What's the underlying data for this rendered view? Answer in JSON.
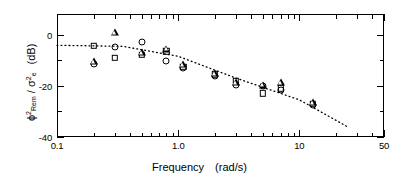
{
  "figure": {
    "x_axis_title_main": "Frequency",
    "x_axis_title_units": "(rad/s)",
    "y_axis_title": "ϕ²Rem / σ²e  (dB)"
  },
  "chart_data": {
    "type": "scatter",
    "title": "",
    "xlabel": "Frequency   (rad/s)",
    "ylabel": "ϕ²_Rem / σ²_e  (dB)",
    "xscale": "log",
    "yscale": "linear",
    "xlim": [
      0.1,
      50
    ],
    "ylim": [
      -40,
      8
    ],
    "grid": false,
    "legend": "none",
    "xticklabels": [
      "0.1",
      "1.0",
      "10",
      "50"
    ],
    "xtickvalues": [
      0.1,
      1.0,
      10,
      50
    ],
    "yticklabels": [
      "0",
      "-20",
      "-40"
    ],
    "ytickvalues": [
      0,
      -20,
      -40
    ],
    "minor_x_ticks": [
      0.2,
      0.3,
      0.4,
      0.5,
      0.6,
      0.7,
      0.8,
      0.9,
      2,
      3,
      4,
      5,
      6,
      7,
      8,
      9,
      20,
      30,
      40
    ],
    "series": [
      {
        "name": "square-markers",
        "marker": "square",
        "points": [
          {
            "x": 0.2,
            "y": -4.5
          },
          {
            "x": 0.3,
            "y": -9.0
          },
          {
            "x": 0.5,
            "y": -8.0
          },
          {
            "x": 0.8,
            "y": -6.5
          },
          {
            "x": 1.1,
            "y": -12.5
          },
          {
            "x": 2.0,
            "y": -15.5
          },
          {
            "x": 3.0,
            "y": -18.0
          },
          {
            "x": 5.0,
            "y": -23.0
          },
          {
            "x": 7.0,
            "y": -21.0
          },
          {
            "x": 13.0,
            "y": -27.0
          }
        ]
      },
      {
        "name": "circle-markers",
        "marker": "circle",
        "points": [
          {
            "x": 0.2,
            "y": -11.5
          },
          {
            "x": 0.3,
            "y": -5.0
          },
          {
            "x": 0.5,
            "y": -3.0
          },
          {
            "x": 0.8,
            "y": -10.5
          },
          {
            "x": 1.1,
            "y": -13.0
          },
          {
            "x": 2.0,
            "y": -16.0
          },
          {
            "x": 3.0,
            "y": -19.5
          },
          {
            "x": 5.0,
            "y": -20.0
          },
          {
            "x": 7.0,
            "y": -21.5
          },
          {
            "x": 13.0,
            "y": -27.5
          }
        ]
      },
      {
        "name": "triangle-markers",
        "marker": "triangle",
        "points": [
          {
            "x": 0.2,
            "y": -10.5
          },
          {
            "x": 0.3,
            "y": 1.0
          },
          {
            "x": 0.5,
            "y": -7.0
          },
          {
            "x": 0.8,
            "y": -5.5
          },
          {
            "x": 1.1,
            "y": -11.5
          },
          {
            "x": 2.0,
            "y": -15.0
          },
          {
            "x": 3.0,
            "y": -18.5
          },
          {
            "x": 5.0,
            "y": -19.5
          },
          {
            "x": 7.0,
            "y": -18.5
          },
          {
            "x": 13.0,
            "y": -26.5
          }
        ]
      }
    ],
    "fit_line": {
      "name": "fitted-trend",
      "style": "dotted",
      "points": [
        {
          "x": 0.1,
          "y": -4.2
        },
        {
          "x": 0.35,
          "y": -4.6
        },
        {
          "x": 1.0,
          "y": -8.5
        },
        {
          "x": 3.0,
          "y": -17.0
        },
        {
          "x": 10.0,
          "y": -25.5
        },
        {
          "x": 25.0,
          "y": -36.0
        }
      ]
    }
  }
}
